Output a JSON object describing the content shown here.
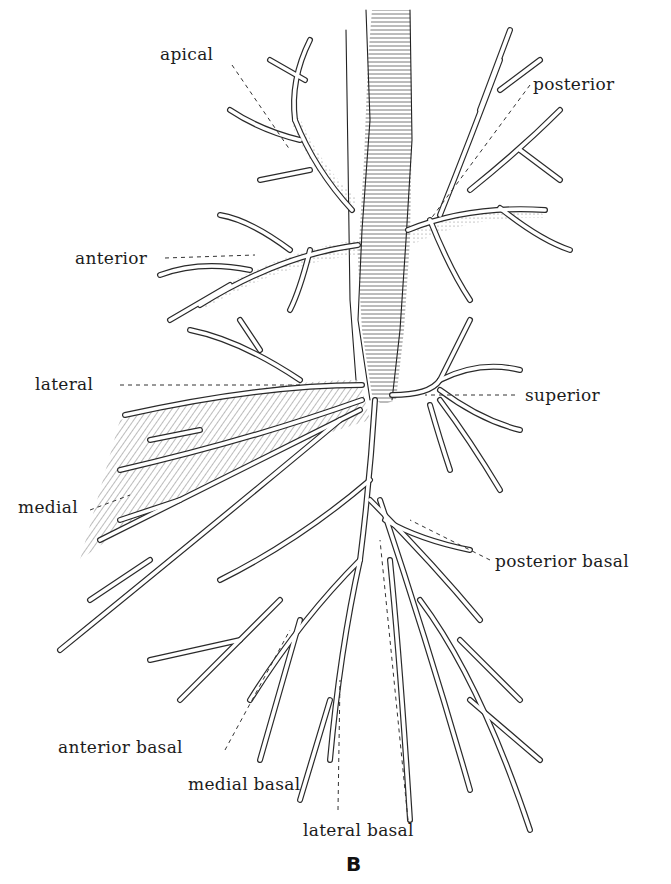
{
  "figure": {
    "panel_letter": "B",
    "labels": {
      "apical": "apical",
      "posterior": "posterior",
      "anterior": "anterior",
      "lateral": "lateral",
      "superior": "superior",
      "medial": "medial",
      "posterior_basal": "posterior basal",
      "anterior_basal": "anterior basal",
      "medial_basal": "medial basal",
      "lateral_basal": "lateral basal"
    }
  }
}
